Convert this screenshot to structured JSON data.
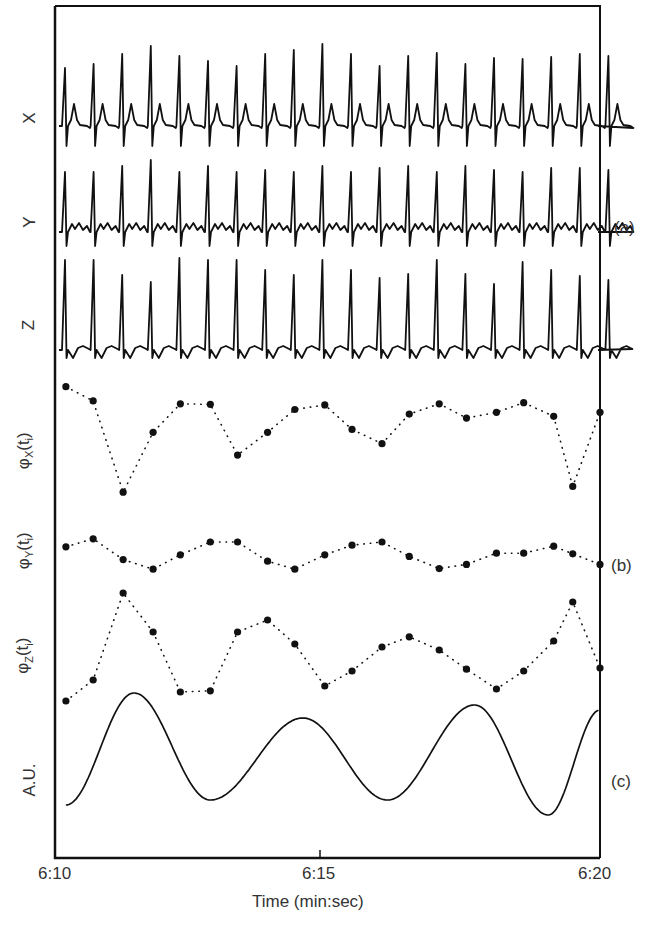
{
  "chart_data": [
    {
      "id": "a",
      "panel_label": "(a)",
      "type": "line",
      "title": "ECG leads X, Y, Z",
      "xlabel": "Time (min:sec)",
      "x_range": [
        "6:10",
        "6:20"
      ],
      "series": [
        {
          "name": "X",
          "description": "Tall QRS spikes with prominent T-waves"
        },
        {
          "name": "Y",
          "description": "QRS spikes with small undulating baseline"
        },
        {
          "name": "Z",
          "description": "QRS spikes with negative deflections"
        }
      ],
      "beat_count": 20,
      "rr_interval_sec": 0.52
    },
    {
      "id": "b",
      "panel_label": "(b)",
      "type": "scatter",
      "title": "Beat-to-beat phase values",
      "xlabel": "Time (min:sec)",
      "x_seconds": [
        0.2,
        0.7,
        1.25,
        1.8,
        2.3,
        2.85,
        3.35,
        3.9,
        4.4,
        4.95,
        5.45,
        6.0,
        6.5,
        7.05,
        7.55,
        8.1,
        8.6,
        9.15,
        9.5,
        10.0
      ],
      "series": [
        {
          "name": "φX(ti)",
          "y_relative": [
            0.9,
            0.65,
            -0.95,
            0.1,
            0.6,
            0.59,
            -0.3,
            0.1,
            0.5,
            0.58,
            0.15,
            -0.1,
            0.42,
            0.6,
            0.35,
            0.45,
            0.62,
            0.38,
            -0.85,
            0.45
          ]
        },
        {
          "name": "φY(ti)",
          "y_relative": [
            0.1,
            0.35,
            -0.3,
            -0.6,
            -0.15,
            0.25,
            0.25,
            -0.35,
            -0.6,
            -0.15,
            0.15,
            0.25,
            -0.2,
            -0.58,
            -0.45,
            -0.1,
            -0.1,
            0.12,
            -0.12,
            -0.45
          ]
        },
        {
          "name": "φZ(ti)",
          "y_relative": [
            -0.85,
            -0.5,
            0.95,
            0.3,
            -0.7,
            -0.68,
            0.3,
            0.5,
            0.1,
            -0.6,
            -0.35,
            0.05,
            0.22,
            0.0,
            -0.32,
            -0.65,
            -0.35,
            0.15,
            0.8,
            -0.3
          ]
        }
      ]
    },
    {
      "id": "c",
      "panel_label": "(c)",
      "type": "line",
      "title": "Respiratory signal",
      "ylabel": "A.U.",
      "xlabel": "Time (min:sec)",
      "peaks_sec": [
        1.45,
        4.55,
        7.7
      ],
      "troughs_sec": [
        2.85,
        6.1,
        9.05
      ],
      "description": "Smooth quasi-sinusoidal oscillation, ~3.1 s period, ending rising at 6:20"
    }
  ],
  "labels": {
    "lead_x": "X",
    "lead_y": "Y",
    "lead_z": "Z",
    "phi_x": "φX(ti)",
    "phi_y": "φY(ti)",
    "phi_z": "φZ(ti)",
    "au": "A.U.",
    "panel_a": "(a)",
    "panel_b": "(b)",
    "panel_c": "(c)"
  },
  "axis": {
    "ticks": [
      "6:10",
      "6:15",
      "6:20"
    ],
    "title": "Time (min:sec)"
  },
  "colors": {
    "ink": "#111111",
    "text": "#333333",
    "background": "#ffffff"
  }
}
